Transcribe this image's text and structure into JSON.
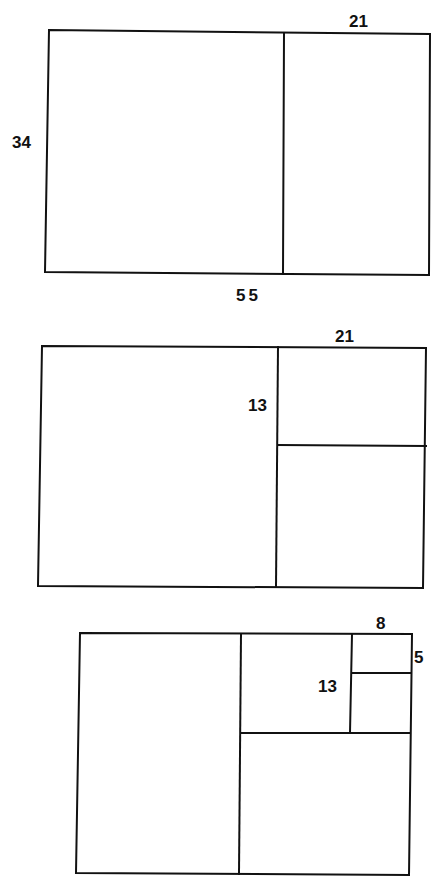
{
  "diagrams": [
    {
      "name": "rectangle-34x55",
      "labels": {
        "top": "21",
        "left": "34",
        "bottom": "55"
      },
      "description": "34x55 rectangle split into a 34x34 square and a 34x21 rectangle"
    },
    {
      "name": "rectangle-subdivided-21x34",
      "labels": {
        "top": "21",
        "inner": "13"
      },
      "description": "the 21x34 part split into a 21x21 square and a 13x21 rectangle"
    },
    {
      "name": "rectangle-subdivided-8x13",
      "labels": {
        "top": "8",
        "right": "5",
        "inner": "13"
      },
      "description": "further split into 13x13, 8x8 and 5x8 parts"
    }
  ],
  "colors": {
    "line": "#111111",
    "background": "#ffffff"
  }
}
